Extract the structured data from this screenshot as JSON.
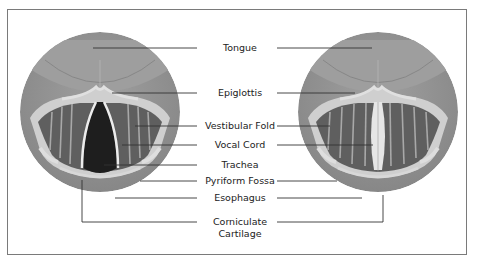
{
  "diagram": {
    "title": "",
    "panels": [
      {
        "id": "left",
        "state": "vocal cords open (abducted)"
      },
      {
        "id": "right",
        "state": "vocal cords closed (adducted)"
      }
    ],
    "labels": {
      "tongue": "Tongue",
      "epiglottis": "Epiglottis",
      "vestibular_fold": "Vestibular Fold",
      "vocal_cord": "Vocal Cord",
      "trachea": "Trachea",
      "pyriform_fossa": "Pyriform Fossa",
      "esophagus": "Esophagus",
      "corniculate_line1": "Corniculate",
      "corniculate_line2": "Cartilage"
    },
    "colors": {
      "outer_tissue": "#8e8e8e",
      "tongue": "#9c9c9c",
      "epiglottis": "#d2d2d2",
      "folds": "#5f5f5f",
      "trachea": "#1e1e1e",
      "cord": "#e8e8e8",
      "leader": "#333333",
      "frame": "#7a7a7a"
    }
  }
}
